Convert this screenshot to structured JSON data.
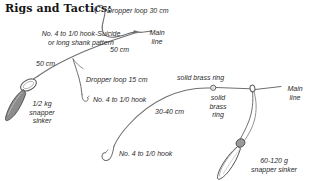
{
  "title": "Rigs and Tactics:",
  "colors": {
    "line": "#6f6f6f",
    "line_dark": "#4a4a4a",
    "text": "#2a2a2a",
    "title": "#141414",
    "sinker_fill": "#8c8c8c",
    "background": "#ffffff"
  },
  "rigs": [
    {
      "name": "dropper-loop-rig",
      "labels": {
        "dropper_loop_top": "Dropper loop 30 cm",
        "hook_pattern": "No. 4 to 1/0 hook-Suicide\nor long shank pattern",
        "hook_pattern_line1": "No. 4 to 1/0 hook-Suicide",
        "hook_pattern_line2": "or long shank pattern",
        "main_line": "Main\nline",
        "main_line_word1": "Main",
        "main_line_word2": "line",
        "length_upper": "50 cm",
        "length_lower": "50 cm",
        "dropper_loop_mid": "Dropper loop 15 cm",
        "hook_mid": "No. 4 to 1/0 hook",
        "sinker": "1/2 kg\nsnapper\nsinker",
        "sinker_line1": "1/2 kg",
        "sinker_line2": "snapper",
        "sinker_line3": "sinker"
      }
    },
    {
      "name": "running-sinker-rig",
      "labels": {
        "brass_ring_top": "solid brass ring",
        "brass_ring_stacked_line1": "solid",
        "brass_ring_stacked_line2": "brass",
        "brass_ring_stacked_line3": "ring",
        "main_line_word1": "Main",
        "main_line_word2": "line",
        "trace_length": "30-40 cm",
        "hook": "No. 4 to 1/0 hook",
        "sinker_line1": "60-120 g",
        "sinker_line2": "snapper sinker"
      }
    }
  ],
  "icons": {
    "hook": "fishing-hook-icon",
    "sinker": "snapper-sinker-icon",
    "ring": "solid-brass-ring-icon",
    "dropper_loop": "dropper-loop-icon"
  }
}
